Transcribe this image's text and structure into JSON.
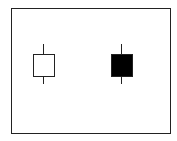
{
  "diagram": {
    "type": "candlestick-pair",
    "frame": {
      "left": 11,
      "top": 8,
      "width": 160,
      "height": 126,
      "border_color": "#222222"
    },
    "candles": [
      {
        "name": "bullish-candle",
        "fill": "#ffffff",
        "stroke": "#222222",
        "wick_x": 43,
        "wick_top": 44,
        "wick_bottom": 84,
        "body_left": 33,
        "body_top": 54,
        "body_width": 22,
        "body_height": 23
      },
      {
        "name": "bearish-candle",
        "fill": "#000000",
        "stroke": "#222222",
        "wick_x": 121,
        "wick_top": 44,
        "wick_bottom": 84,
        "body_left": 111,
        "body_top": 54,
        "body_width": 22,
        "body_height": 23
      }
    ]
  }
}
